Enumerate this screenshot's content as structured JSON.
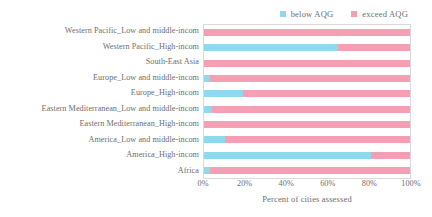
{
  "legend": {
    "position": "top-right",
    "items": [
      {
        "label": "below AQG",
        "color": "#8ed8f0"
      },
      {
        "label": "exceed AQG",
        "color": "#f59fb4"
      }
    ]
  },
  "axis": {
    "x_title": "Percent of cities assessed",
    "x_ticks": [
      "0%",
      "20%",
      "40%",
      "60%",
      "80%",
      "100%"
    ]
  },
  "chart_data": {
    "type": "bar",
    "orientation": "horizontal",
    "stacked": true,
    "stack_mode": "percent",
    "title": "",
    "xlabel": "Percent of cities assessed",
    "ylabel": "",
    "xlim": [
      0,
      100
    ],
    "xticks": [
      0,
      20,
      40,
      60,
      80,
      100
    ],
    "xtick_labels": [
      "0%",
      "20%",
      "40%",
      "60%",
      "80%",
      "100%"
    ],
    "grid": false,
    "legend_position": "top-right",
    "categories": [
      "Western Pacific_Low and middle-incom",
      "Western Pacific_High-incom",
      "South-East Asia",
      "Europe_Low and middle-incom",
      "Europe_High-incom",
      "Eastern Mediterranean_Low and middle-incom",
      "Eastern Mediterranean_High-incom",
      "America_Low and middle-incom",
      "America_High-incom",
      "Africa"
    ],
    "series": [
      {
        "name": "below AQG",
        "color": "#8ed8f0",
        "values": [
          0,
          65,
          0,
          3,
          19,
          4,
          0,
          10,
          81,
          3
        ]
      },
      {
        "name": "exceed AQG",
        "color": "#f59fb4",
        "values": [
          100,
          35,
          100,
          97,
          81,
          96,
          100,
          90,
          19,
          97
        ]
      }
    ]
  }
}
